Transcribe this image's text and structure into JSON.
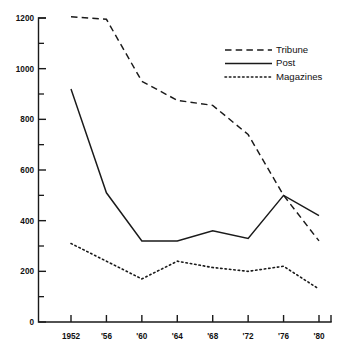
{
  "chart_data": {
    "type": "line",
    "title": "",
    "subtitle": "",
    "xlabel": "",
    "ylabel": "",
    "grid": false,
    "legend_position": "top-right",
    "categories": [
      "1952",
      "'56",
      "'60",
      "'64",
      "'68",
      "'72",
      "'76",
      "'80"
    ],
    "x_tick_labels": [
      "1952",
      "'56",
      "'60",
      "'64",
      "'68",
      "'72",
      "'76",
      "'80"
    ],
    "y_tick_labels": [
      "0",
      "200",
      "400",
      "600",
      "800",
      "1000",
      "1200"
    ],
    "y_tick_values": [
      0,
      200,
      400,
      600,
      800,
      1000,
      1200
    ],
    "y_minor_tick_values": [
      100,
      300,
      500,
      700,
      900,
      1100
    ],
    "xlim": [
      1952,
      1980
    ],
    "ylim": [
      0,
      1200
    ],
    "series": [
      {
        "name": "Tribune",
        "style": "dashed",
        "color": "#1a1a1a",
        "values": [
          1205,
          1195,
          950,
          875,
          855,
          740,
          500,
          320
        ]
      },
      {
        "name": "Post",
        "style": "solid",
        "color": "#1a1a1a",
        "values": [
          920,
          510,
          320,
          320,
          360,
          330,
          500,
          420
        ]
      },
      {
        "name": "Magazines",
        "style": "dotted",
        "color": "#1a1a1a",
        "values": [
          310,
          240,
          170,
          240,
          215,
          200,
          220,
          130
        ]
      }
    ],
    "legend_entries": [
      {
        "label": "Tribune",
        "style": "dashed"
      },
      {
        "label": "Post",
        "style": "solid"
      },
      {
        "label": "Magazines",
        "style": "dotted"
      }
    ]
  },
  "axis": {
    "y_labels": [
      "1200",
      "1000",
      "800",
      "600",
      "400",
      "200",
      "0"
    ],
    "x_labels": [
      "1952",
      "'56",
      "'60",
      "'64",
      "'68",
      "'72",
      "'76",
      "'80"
    ]
  },
  "legend": {
    "items": [
      "Tribune",
      "Post",
      "Magazines"
    ]
  }
}
